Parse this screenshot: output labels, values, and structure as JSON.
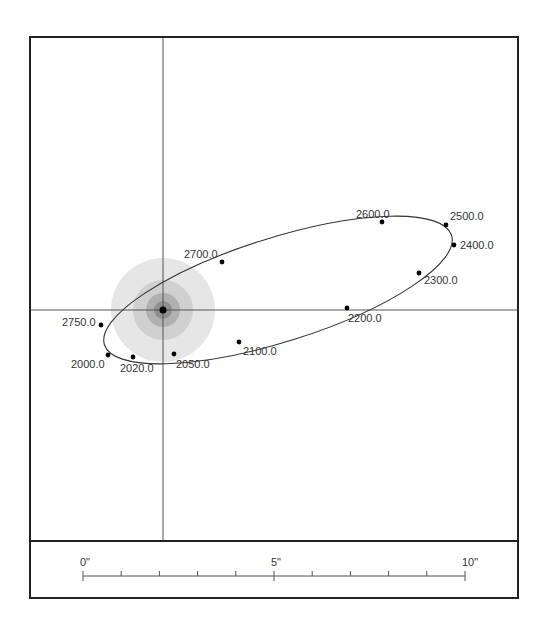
{
  "diagram": {
    "type": "binary-orbit-plot",
    "colors": {
      "frame": "#222222",
      "axis": "#555555",
      "orbit": "#333333",
      "point": "#000000",
      "label": "#333333",
      "glow_outer": "#e4e4e4",
      "glow_mid": "#cfcfcf",
      "glow_inner": "#a8a8a8",
      "glow_core": "#8c8c8c"
    },
    "primary": {
      "x": 163,
      "y": 310
    },
    "orbit_points": [
      {
        "epoch": "2000.0",
        "x": 108,
        "y": 355,
        "lx": 71,
        "ly": 368
      },
      {
        "epoch": "2020.0",
        "x": 133,
        "y": 357,
        "lx": 120,
        "ly": 372
      },
      {
        "epoch": "2050.0",
        "x": 174,
        "y": 354,
        "lx": 176,
        "ly": 368
      },
      {
        "epoch": "2100.0",
        "x": 239,
        "y": 342,
        "lx": 243,
        "ly": 355
      },
      {
        "epoch": "2200.0",
        "x": 347,
        "y": 308,
        "lx": 348,
        "ly": 322
      },
      {
        "epoch": "2300.0",
        "x": 419,
        "y": 273,
        "lx": 424,
        "ly": 284
      },
      {
        "epoch": "2400.0",
        "x": 454,
        "y": 245,
        "lx": 460,
        "ly": 249
      },
      {
        "epoch": "2500.0",
        "x": 446,
        "y": 225,
        "lx": 450,
        "ly": 220
      },
      {
        "epoch": "2600.0",
        "x": 382,
        "y": 222,
        "lx": 356,
        "ly": 218
      },
      {
        "epoch": "2700.0",
        "x": 222,
        "y": 262,
        "lx": 184,
        "ly": 258
      },
      {
        "epoch": "2750.0",
        "x": 101,
        "y": 325,
        "lx": 62,
        "ly": 326
      }
    ],
    "scale_bar": {
      "labels": [
        {
          "text": "0\"",
          "x": 83
        },
        {
          "text": "5\"",
          "x": 274
        },
        {
          "text": "10\"",
          "x": 465
        }
      ],
      "min": 0,
      "max": 10,
      "unit": "arcsec",
      "tick_step": 1
    }
  }
}
